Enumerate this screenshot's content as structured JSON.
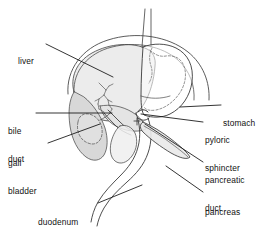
{
  "figure": {
    "type": "anatomical-line-diagram",
    "background": "#ffffff",
    "stroke_color": "#3a3a3a",
    "leader_color": "#1a1a1a",
    "fill_light": "#ececec",
    "fill_mid": "#d8d8d8",
    "fill_dark": "#bdbdbd"
  },
  "labels": [
    {
      "id": "liver",
      "lines": [
        "liver"
      ],
      "x": 18,
      "y": 38,
      "align": "left"
    },
    {
      "id": "bile-duct",
      "lines": [
        "bile",
        "duct"
      ],
      "x": 8,
      "y": 108,
      "align": "left"
    },
    {
      "id": "gall-bladder",
      "lines": [
        "gall",
        "bladder"
      ],
      "x": 8,
      "y": 140,
      "align": "left"
    },
    {
      "id": "duodenum",
      "lines": [
        "duodenum"
      ],
      "x": 38,
      "y": 199,
      "align": "left"
    },
    {
      "id": "stomach",
      "lines": [
        "stomach"
      ],
      "x": 223,
      "y": 100,
      "align": "left"
    },
    {
      "id": "pyloric-sphincter",
      "lines": [
        "pyloric",
        "sphincter"
      ],
      "x": 205,
      "y": 117,
      "align": "left"
    },
    {
      "id": "pancreatic-duct",
      "lines": [
        "pancreatic",
        "duct"
      ],
      "x": 205,
      "y": 157,
      "align": "left"
    },
    {
      "id": "pancreas",
      "lines": [
        "pancreas"
      ],
      "x": 205,
      "y": 189,
      "align": "left"
    }
  ],
  "leader_lines": [
    {
      "id": "liver",
      "from": [
        46,
        44
      ],
      "to": [
        113,
        77
      ]
    },
    {
      "id": "bile-duct",
      "from": [
        36,
        113
      ],
      "to": [
        112,
        113
      ]
    },
    {
      "id": "gall-bladder",
      "from": [
        48,
        143
      ],
      "to": [
        100,
        124
      ]
    },
    {
      "id": "duodenum",
      "from": [
        98,
        203
      ],
      "to": [
        142,
        185
      ]
    },
    {
      "id": "stomach",
      "from": [
        221,
        105
      ],
      "to": [
        180,
        107
      ]
    },
    {
      "id": "pyloric-sphincter",
      "from": [
        203,
        122
      ],
      "to": [
        141,
        114
      ]
    },
    {
      "id": "pancreatic-duct",
      "from": [
        203,
        162
      ],
      "to": [
        145,
        124
      ]
    },
    {
      "id": "pancreas",
      "from": [
        203,
        192
      ],
      "to": [
        166,
        166
      ]
    }
  ],
  "organs": [
    {
      "id": "esophagus",
      "name": "esophagus"
    },
    {
      "id": "stomach-body",
      "name": "stomach"
    },
    {
      "id": "liver-mass",
      "name": "liver"
    },
    {
      "id": "gall-bladder-sac",
      "name": "gall bladder"
    },
    {
      "id": "bile-duct-tree",
      "name": "bile duct"
    },
    {
      "id": "pyloric-ring",
      "name": "pyloric sphincter"
    },
    {
      "id": "pancreas-body",
      "name": "pancreas"
    },
    {
      "id": "pancreatic-duct-line",
      "name": "pancreatic duct"
    },
    {
      "id": "duodenum-loop",
      "name": "duodenum"
    },
    {
      "id": "rib-arc",
      "name": "diaphragm outline"
    }
  ]
}
